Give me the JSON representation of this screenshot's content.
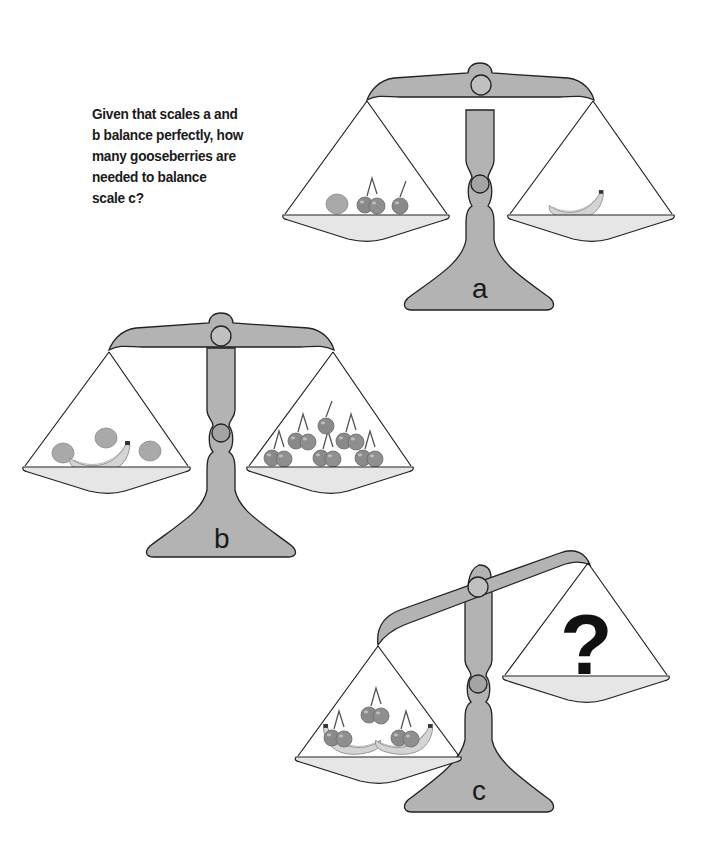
{
  "puzzle": {
    "question_lines": [
      "Given that scales a and",
      "b balance perfectly, how",
      "many gooseberries are",
      "needed to balance",
      "scale c?"
    ],
    "scales": [
      {
        "label": "a",
        "left_pan": [
          "gooseberry",
          "cherry-pair",
          "cherry"
        ],
        "right_pan": [
          "banana"
        ],
        "state": "balanced"
      },
      {
        "label": "b",
        "left_pan": [
          "gooseberry",
          "banana",
          "gooseberry",
          "gooseberry"
        ],
        "right_pan": [
          "cherry-pair",
          "cherry",
          "cherry-pair",
          "cherry-pair",
          "cherry-pair",
          "cherry-pair"
        ],
        "state": "balanced"
      },
      {
        "label": "c",
        "left_pan": [
          "banana",
          "banana",
          "cherry-pair",
          "cherry-pair",
          "cherry-pair"
        ],
        "right_pan": [
          "?"
        ],
        "state": "tilted"
      }
    ],
    "unknown_symbol": "?"
  },
  "colors": {
    "metal": "#b3b3b3",
    "pan": "#e6e6e6",
    "outline": "#222222",
    "cherry": "#8a8a8a",
    "gooseberry": "#a9a9a9",
    "banana": "#d4d4d4"
  }
}
